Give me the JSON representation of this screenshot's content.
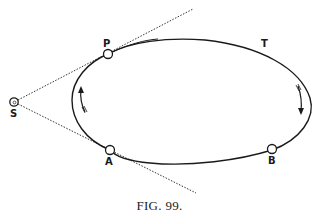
{
  "figure": {
    "caption": "FIG. 99.",
    "points": {
      "S": {
        "label": "S",
        "x": 14,
        "y": 102
      },
      "P": {
        "label": "P",
        "x": 108,
        "y": 54
      },
      "A": {
        "label": "A",
        "x": 110,
        "y": 150
      },
      "B": {
        "label": "B",
        "x": 272,
        "y": 150
      }
    },
    "orbit_label": "T",
    "arrows": [
      {
        "position": "left",
        "direction": "up"
      },
      {
        "position": "right",
        "direction": "down"
      }
    ],
    "colors": {
      "ink": "#1a1a1a",
      "background": "#ffffff"
    }
  }
}
